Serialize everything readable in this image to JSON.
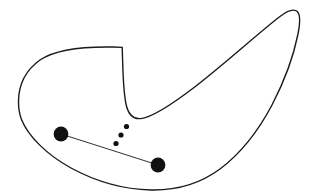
{
  "figure": {
    "name": "non-convex-region-with-two-points",
    "background_color": "#ffffff",
    "canvas": {
      "width": 312,
      "height": 193
    },
    "region": {
      "label": "closed-curve-region",
      "stroke_color": "#1a1a1a",
      "fill_color": "#ffffff",
      "stroke_width": 1.4,
      "path": "M 18.5 101 C 18.8 84 26 70 40 60 C 56 49 84 46.5 113 47 C 117 47 120.5 47.2 122.2 47.4 L 122.6 60 C 123 76 123.6 92 126 104 C 128.2 114.5 133 119.2 140.5 118.6 C 152 117.6 170 106 196 86 C 228 61 262 30 280 16.5 C 288 10.4 293.6 8.4 297.2 11.6 C 300.6 14.7 300.4 22 298 34 C 294 54 285 80 272 105 C 258 131.5 240 154 220 169 C 199 184.5 176 190.5 151 190 C 124 189.4 96 181.6 71 168 C 46.5 154.5 28 136 21.5 119.5 C 19.3 113.8 18.4 107.4 18.5 101 Z"
    },
    "connector": {
      "label": "segment-between-points",
      "stroke_color": "#1a1a1a",
      "stroke_width": 0.9,
      "from": {
        "x": 61,
        "y": 134
      },
      "to": {
        "x": 158,
        "y": 165
      }
    },
    "points": [
      {
        "name": "point-left",
        "x": 61,
        "y": 134,
        "r": 7.4,
        "color": "#111111"
      },
      {
        "name": "point-right",
        "x": 158,
        "y": 165,
        "r": 7.4,
        "color": "#111111"
      }
    ],
    "ellipsis": {
      "label": "three-dots-ellipsis",
      "color": "#111111",
      "dots": [
        {
          "x": 126.5,
          "y": 126.5,
          "r": 2.6
        },
        {
          "x": 121.0,
          "y": 135.0,
          "r": 2.6
        },
        {
          "x": 116.0,
          "y": 143.5,
          "r": 2.6
        }
      ]
    }
  }
}
